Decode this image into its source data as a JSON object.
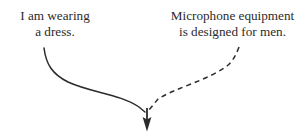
{
  "figure": {
    "background_color": "#ffffff",
    "stroke_color": "#2b2b2b",
    "type": "two-premise converging arrow diagram"
  },
  "labels": {
    "left": {
      "name": "premise-left",
      "line1": "I am wearing",
      "line2": "a dress."
    },
    "right": {
      "name": "premise-right",
      "line1": "Microphone equipment",
      "line2": "is designed for men."
    }
  },
  "arrows": {
    "solid": {
      "style": "solid",
      "from": "left-label",
      "to": "convergence-point",
      "start": [
        44,
        48
      ],
      "end": [
        146,
        110
      ]
    },
    "dashed": {
      "style": "dashed",
      "dash_pattern": "5 4",
      "from": "right-label",
      "to": "convergence-point",
      "start": [
        239,
        47
      ],
      "end": [
        148,
        110
      ]
    },
    "arrowhead": {
      "direction": "down",
      "tip": [
        147,
        131
      ]
    }
  }
}
